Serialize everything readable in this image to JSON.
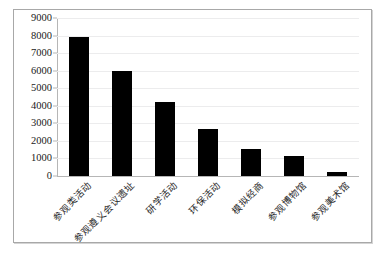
{
  "chart_data": {
    "type": "bar",
    "title": "",
    "subtitle": "",
    "xlabel": "",
    "ylabel": "",
    "ylim": [
      0,
      9000
    ],
    "ytick_step": 1000,
    "yticks": [
      "9000",
      "8000",
      "7000",
      "6000",
      "5000",
      "4000",
      "3000",
      "2000",
      "1000",
      "0"
    ],
    "grid": true,
    "legend": false,
    "legend_position": "none",
    "bar_color": "#000000",
    "categories": [
      "参观类活动",
      "参观遵义会议遗址",
      "研学活动",
      "环保活动",
      "模拟经商",
      "参观博物馆",
      "参观美术馆"
    ],
    "values": [
      7900,
      6000,
      4200,
      2700,
      1550,
      1150,
      250
    ]
  },
  "figure": {
    "border_color": "#a8a8a8",
    "grid_color": "#ececed",
    "axis_color": "#b6b6b6",
    "background": "#ffffff"
  }
}
